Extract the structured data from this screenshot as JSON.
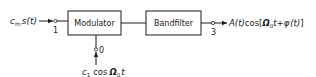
{
  "diagram": {
    "type": "block-diagram",
    "blocks": [
      {
        "id": "modulator",
        "label": "Modulator"
      },
      {
        "id": "bandfilter",
        "label": "Bandfilter"
      }
    ],
    "terminals": [
      {
        "id": "1",
        "label": "1"
      },
      {
        "id": "0",
        "label": "0"
      },
      {
        "id": "3",
        "label": "3"
      }
    ],
    "signals": {
      "input": {
        "coef": "c",
        "coef_sub": "m",
        "func": "s",
        "arg": "(t)"
      },
      "carrier": {
        "coef": "c",
        "coef_sub": "1",
        "op": "cos",
        "omega": "Ω",
        "omega_sub": "0",
        "arg": "t"
      },
      "output": {
        "amp": "A",
        "amp_arg": "(t)",
        "op": "cos",
        "bracket_open": "[",
        "omega": "Ω",
        "omega_sub": "0",
        "t": "t",
        "plus": "+",
        "phi": "φ",
        "phi_arg": "(t)",
        "bracket_close": "]"
      }
    },
    "colors": {
      "stroke": "#1a1a1a",
      "background": "#ffffff"
    }
  }
}
